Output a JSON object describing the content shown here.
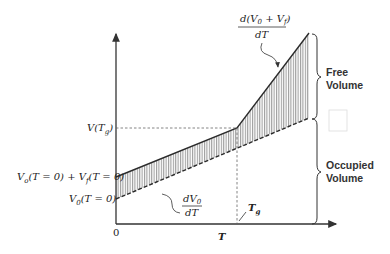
{
  "diagram": {
    "axes": {
      "x_label": "T",
      "origin_label": "0"
    },
    "y_labels": {
      "v_tg": "V(T",
      "v_tg_sub": "g",
      "v_tg_close": ")",
      "v0_plus_vf": "V",
      "v0_plus_vf_sub1": "o",
      "v0_plus_vf_mid": "(T = 0) + V",
      "v0_plus_vf_sub2": "f",
      "v0_plus_vf_end": "(T = 0)",
      "v0": "V",
      "v0_sub": "0",
      "v0_end": "(T = 0)"
    },
    "annotations": {
      "slope_total_num_a": "d(V",
      "slope_total_sub0": "0",
      "slope_total_num_b": " + V",
      "slope_total_subf": "f",
      "slope_total_num_c": ")",
      "slope_total_den": "dT",
      "slope_occ_num": "dV",
      "slope_occ_sub": "0",
      "slope_occ_den": "dT",
      "tg": "T",
      "tg_sub": "g"
    },
    "braces": {
      "free_line1": "Free",
      "free_line2": "Volume",
      "occupied_line1": "Occupied",
      "occupied_line2": "Volume"
    },
    "colors": {
      "line": "#2b2b2b",
      "hatch": "#555555",
      "dashed": "#666666"
    }
  }
}
